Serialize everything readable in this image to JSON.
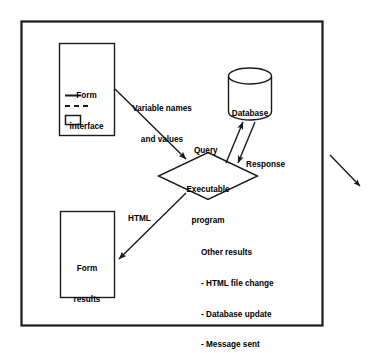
{
  "diagram": {
    "frame": {
      "name": "outer-frame",
      "x": 21,
      "y": 21,
      "width": 301,
      "height": 304,
      "stroke": "#1a1a1a",
      "stroke_width": 2.2,
      "fill": "#ffffff"
    },
    "style": {
      "line_color": "#1a1a1a",
      "text_color": "#000000",
      "background": "#ffffff"
    },
    "nodes": [
      {
        "id": "form-interface",
        "shape": "rectangle",
        "label_lines": [
          "Form",
          "interface"
        ],
        "x": 59,
        "y": 43,
        "width": 55,
        "height": 92,
        "contents": [
          {
            "kind": "solid-line",
            "label": "text-field-line"
          },
          {
            "kind": "dashed-line",
            "label": "dashed-field-line"
          },
          {
            "kind": "rectangle",
            "label": "button-box"
          }
        ]
      },
      {
        "id": "database",
        "shape": "cylinder",
        "label_lines": [
          "Database"
        ],
        "x": 228,
        "y": 68,
        "width": 44,
        "height": 52
      },
      {
        "id": "executable-program",
        "shape": "diamond",
        "label_lines": [
          "Executable",
          "program"
        ],
        "cx": 208,
        "cy": 176,
        "rx": 49,
        "ry": 24
      },
      {
        "id": "form-results",
        "shape": "rectangle",
        "label_lines": [
          "Form",
          "results"
        ],
        "x": 60,
        "y": 211,
        "width": 54,
        "height": 86
      }
    ],
    "edges": [
      {
        "id": "variable-names-and-values",
        "from": "form-interface",
        "to": "executable-program",
        "label_lines": [
          "Variable names",
          "and values"
        ],
        "arrowheads": "end"
      },
      {
        "id": "query",
        "from": "executable-program",
        "to": "database",
        "label_lines": [
          "Query"
        ],
        "arrowheads": "end"
      },
      {
        "id": "response",
        "from": "database",
        "to": "executable-program",
        "label_lines": [
          "Response"
        ],
        "arrowheads": "end"
      },
      {
        "id": "html",
        "from": "executable-program",
        "to": "form-results",
        "label_lines": [
          "HTML"
        ],
        "arrowheads": "end"
      },
      {
        "id": "external-output",
        "from": "frame",
        "to": "outside",
        "label_lines": [],
        "arrowheads": "end"
      }
    ],
    "labels": {
      "form_interface_line1": "Form",
      "form_interface_line2": "interface",
      "database": "Database",
      "executable_line1": "Executable",
      "executable_line2": "program",
      "form_results_line1": "Form",
      "form_results_line2": "results",
      "variable_line1": "Variable names",
      "variable_line2": "and values",
      "query": "Query",
      "response": "Response",
      "html": "HTML"
    },
    "other_results": {
      "heading": "Other results",
      "items": [
        "- HTML file change",
        "- Database update",
        "- Message sent"
      ]
    }
  }
}
